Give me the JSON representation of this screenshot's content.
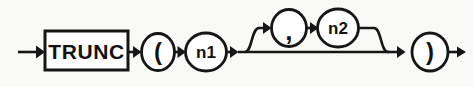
{
  "diagram": {
    "kind": "railroad-syntax-diagram",
    "title": "TRUNC",
    "background_color": "#f9f9f7",
    "line_color": "#161616",
    "node_fill_color": "#ffffff",
    "entry": {
      "name": "entry-arrow",
      "label": ""
    },
    "exit": {
      "name": "exit-arrow",
      "label": ""
    },
    "nodes": [
      {
        "id": "trunc",
        "shape": "rectangle",
        "label": "TRUNC",
        "role": "keyword"
      },
      {
        "id": "open-paren",
        "shape": "ellipse",
        "label": "(",
        "role": "punctuation"
      },
      {
        "id": "n1",
        "shape": "ellipse",
        "label": "n1",
        "role": "parameter"
      },
      {
        "id": "comma",
        "shape": "ellipse",
        "label": ",",
        "role": "punctuation"
      },
      {
        "id": "n2",
        "shape": "ellipse",
        "label": "n2",
        "role": "parameter"
      },
      {
        "id": "close-paren",
        "shape": "ellipse",
        "label": ")",
        "role": "punctuation"
      }
    ],
    "branches": [
      {
        "id": "optional-second-argument",
        "description": "optional",
        "contains": [
          "comma",
          "n2"
        ]
      }
    ]
  }
}
